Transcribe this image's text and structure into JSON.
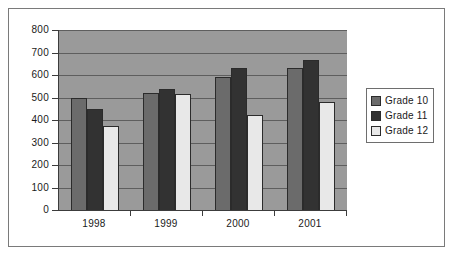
{
  "chart_data": {
    "type": "bar",
    "title": "",
    "xlabel": "",
    "ylabel": "",
    "categories": [
      "1998",
      "1999",
      "2000",
      "2001"
    ],
    "series": [
      {
        "name": "Grade 10",
        "color": "#6b6b6b",
        "values": [
          500,
          520,
          590,
          632
        ]
      },
      {
        "name": "Grade 11",
        "color": "#323232",
        "values": [
          450,
          537,
          632,
          667
        ]
      },
      {
        "name": "Grade 12",
        "color": "#e8e8e8",
        "values": [
          375,
          515,
          423,
          480
        ]
      }
    ],
    "ylim": [
      0,
      800
    ],
    "ytick_labels": [
      "800",
      "700",
      "600",
      "500",
      "400",
      "300",
      "200",
      "100",
      "0"
    ],
    "ytick_values": [
      800,
      700,
      600,
      500,
      400,
      300,
      200,
      100,
      0
    ],
    "grid": true,
    "legend_position": "right",
    "plot_background": "#9a9a9a",
    "gridline_color": "#5e5e5e",
    "axis_color": "#3c3c3c",
    "frame_color": "#7a7a7a"
  }
}
